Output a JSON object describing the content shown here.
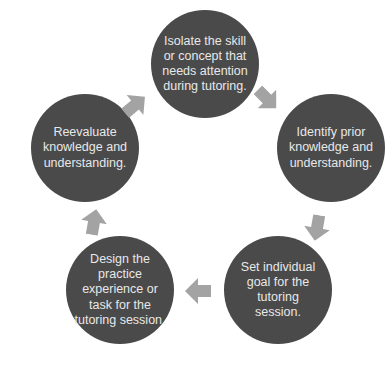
{
  "diagram": {
    "type": "cycle",
    "colors": {
      "node_fill": "#4a4a4a",
      "node_text": "#e8e8e8",
      "arrow": "#a3a3a3",
      "background": "#ffffff"
    },
    "nodes": [
      {
        "id": "isolate",
        "text": "Isolate the skill or concept that needs attention during tutoring."
      },
      {
        "id": "identify",
        "text": "Identify prior knowledge and understanding."
      },
      {
        "id": "set-goal",
        "text": "Set individual goal for the tutoring session."
      },
      {
        "id": "design",
        "text": "Design the practice experience or task for the tutoring session."
      },
      {
        "id": "reevaluate",
        "text": "Reevaluate knowledge and understanding."
      }
    ],
    "edges": [
      {
        "from": "isolate",
        "to": "identify"
      },
      {
        "from": "identify",
        "to": "set-goal"
      },
      {
        "from": "set-goal",
        "to": "design"
      },
      {
        "from": "design",
        "to": "reevaluate"
      },
      {
        "from": "reevaluate",
        "to": "isolate"
      }
    ]
  }
}
